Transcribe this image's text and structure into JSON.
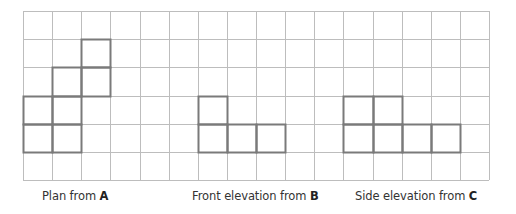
{
  "grid": {
    "origin_x": 23,
    "origin_y": 11,
    "cell_w": 29.125,
    "cell_h": 28.17,
    "cols": 16,
    "rows": 6,
    "grid_color": "#bdbdbd",
    "shape_color": "#7a7a7a"
  },
  "shapes": [
    {
      "name": "plan-from-a",
      "cells": [
        [
          2,
          1
        ],
        [
          1,
          2
        ],
        [
          2,
          2
        ],
        [
          0,
          3
        ],
        [
          1,
          3
        ],
        [
          0,
          4
        ],
        [
          1,
          4
        ]
      ]
    },
    {
      "name": "front-elevation-from-b",
      "cells": [
        [
          6,
          3
        ],
        [
          6,
          4
        ],
        [
          7,
          4
        ],
        [
          8,
          4
        ]
      ]
    },
    {
      "name": "side-elevation-from-c",
      "cells": [
        [
          11,
          3
        ],
        [
          12,
          3
        ],
        [
          11,
          4
        ],
        [
          12,
          4
        ],
        [
          13,
          4
        ],
        [
          14,
          4
        ]
      ]
    }
  ],
  "labels": [
    {
      "name": "plan-label",
      "text": "Plan from ",
      "letter": "A",
      "x": 42
    },
    {
      "name": "front-elevation-label",
      "text": "Front elevation from ",
      "letter": "B",
      "x": 192
    },
    {
      "name": "side-elevation-label",
      "text": "Side elevation from ",
      "letter": "C",
      "x": 355
    }
  ]
}
